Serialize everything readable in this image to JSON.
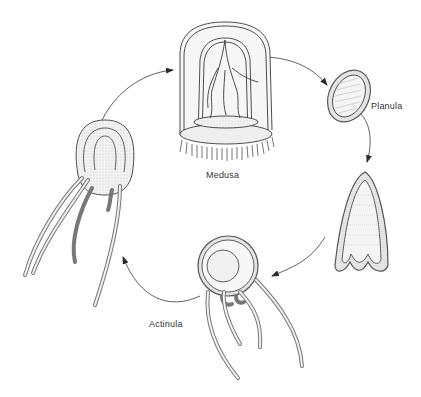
{
  "diagram": {
    "stages": [
      {
        "id": "medusa",
        "label": "Medusa"
      },
      {
        "id": "planula",
        "label": "Planula"
      },
      {
        "id": "settling-planula",
        "label": ""
      },
      {
        "id": "actinula",
        "label": "Actinula"
      },
      {
        "id": "juvenile",
        "label": ""
      }
    ],
    "flow": [
      "medusa",
      "planula",
      "settling-planula",
      "actinula",
      "juvenile",
      "medusa"
    ],
    "colors": {
      "line": "#3a3a3a",
      "fill": "#efefef",
      "stipple": "#bdbdbd",
      "background": "#ffffff"
    }
  }
}
